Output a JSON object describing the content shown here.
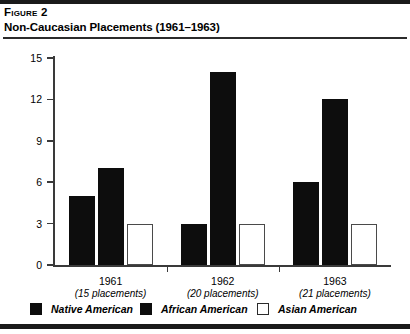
{
  "figure": {
    "label": "Figure 2",
    "title": "Non-Caucasian Placements (1961–1963)"
  },
  "chart_data": {
    "type": "bar",
    "title": "Non-Caucasian Placements (1961–1963)",
    "xlabel": "",
    "ylabel": "",
    "categories": [
      "1961",
      "1962",
      "1963"
    ],
    "category_sublabels": [
      "(15 placements)",
      "(20 placements)",
      "(21 placements)"
    ],
    "series": [
      {
        "name": "Native American",
        "values": [
          5,
          3,
          6
        ],
        "color": "#0d0d0d",
        "style": "solid"
      },
      {
        "name": "African American",
        "values": [
          7,
          14,
          12
        ],
        "color": "#0d0d0d",
        "style": "solid"
      },
      {
        "name": "Asian American",
        "values": [
          3,
          3,
          3
        ],
        "color": "#ffffff",
        "style": "hollow"
      }
    ],
    "ylim": [
      0,
      15
    ],
    "yticks": [
      0,
      3,
      6,
      9,
      12,
      15
    ],
    "ytick_labels": [
      "0",
      "3",
      "6",
      "9",
      "12",
      "15"
    ],
    "grid": false,
    "legend_position": "bottom"
  },
  "legend": {
    "items": [
      {
        "label": "Native American",
        "style": "solid"
      },
      {
        "label": "African American",
        "style": "solid"
      },
      {
        "label": "Asian American",
        "style": "hollow"
      }
    ]
  }
}
